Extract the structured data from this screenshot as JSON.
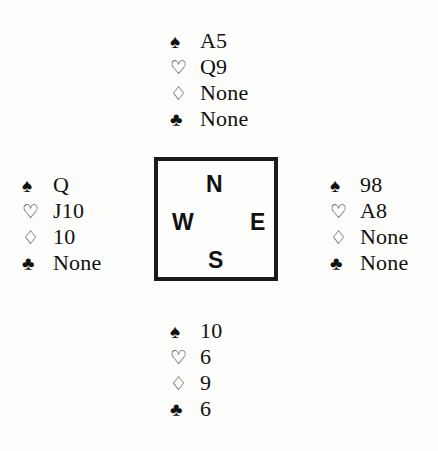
{
  "diagram": {
    "type": "bridge-hand-diagram",
    "background_color": "#fdfdfc",
    "ink_color": "#111111"
  },
  "suits": {
    "spades": {
      "name": "spade-suit-symbol",
      "glyph": "♠",
      "filled": true
    },
    "hearts": {
      "name": "heart-suit-symbol",
      "glyph": "♡",
      "filled": false
    },
    "diamonds": {
      "name": "diamond-suit-symbol",
      "glyph": "♢",
      "filled": false
    },
    "clubs": {
      "name": "club-suit-symbol",
      "glyph": "♣",
      "filled": true
    }
  },
  "compass": {
    "north_label": "N",
    "west_label": "W",
    "east_label": "E",
    "south_label": "S"
  },
  "hands": {
    "north": {
      "spades": "A5",
      "hearts": "Q9",
      "diamonds": "None",
      "clubs": "None"
    },
    "west": {
      "spades": "Q",
      "hearts": "J10",
      "diamonds": "10",
      "clubs": "None"
    },
    "east": {
      "spades": "98",
      "hearts": "A8",
      "diamonds": "None",
      "clubs": "None"
    },
    "south": {
      "spades": "10",
      "hearts": "6",
      "diamonds": "9",
      "clubs": "6"
    }
  }
}
